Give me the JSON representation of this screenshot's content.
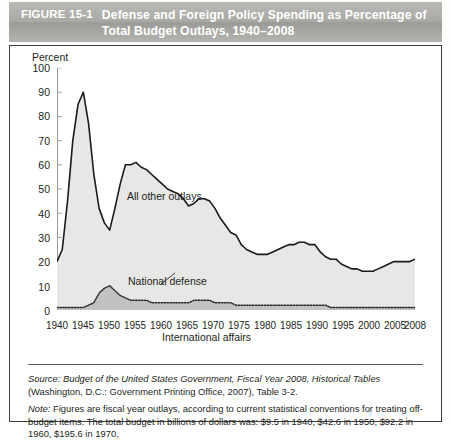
{
  "figure": {
    "number": "FIGURE 15-1",
    "title": "Defense and Foreign Policy Spending as Percentage of Total Budget Outlays, 1940–2008"
  },
  "chart_data": {
    "type": "area",
    "title": "Defense and Foreign Policy Spending as Percentage of Total Budget Outlays, 1940–2008",
    "xlabel": "",
    "ylabel": "Percent",
    "ylim": [
      0,
      100
    ],
    "xlim": [
      1940,
      2008
    ],
    "grid": false,
    "legend_position": "inline-annotations",
    "ytick_labels": [
      "0",
      "10",
      "20",
      "30",
      "40",
      "50",
      "60",
      "70",
      "80",
      "90",
      "100"
    ],
    "xtick_labels": [
      "1940",
      "1945",
      "1950",
      "1955",
      "1960",
      "1965",
      "1970",
      "1975",
      "1980",
      "1985",
      "1990",
      "1995",
      "2000",
      "2005",
      "2008"
    ],
    "annotations": [
      {
        "text": "All other outlays",
        "x": 1958,
        "y": 72
      },
      {
        "text": "National defense",
        "x": 1960,
        "y": 38
      },
      {
        "text": "International affairs",
        "x": 1962,
        "y": 11
      }
    ],
    "x": [
      1940,
      1941,
      1942,
      1943,
      1944,
      1945,
      1946,
      1947,
      1948,
      1949,
      1950,
      1951,
      1952,
      1953,
      1954,
      1955,
      1956,
      1957,
      1958,
      1959,
      1960,
      1961,
      1962,
      1963,
      1964,
      1965,
      1966,
      1967,
      1968,
      1969,
      1970,
      1971,
      1972,
      1973,
      1974,
      1975,
      1976,
      1977,
      1978,
      1979,
      1980,
      1981,
      1982,
      1983,
      1984,
      1985,
      1986,
      1987,
      1988,
      1989,
      1990,
      1991,
      1992,
      1993,
      1994,
      1995,
      1996,
      1997,
      1998,
      1999,
      2000,
      2001,
      2002,
      2003,
      2004,
      2005,
      2006,
      2007,
      2008
    ],
    "series": [
      {
        "name": "National defense",
        "values": [
          20,
          25,
          45,
          70,
          85,
          90,
          77,
          56,
          42,
          36,
          33,
          42,
          52,
          60,
          60,
          61,
          59,
          58,
          56,
          54,
          52,
          50,
          49,
          48,
          46,
          43,
          44,
          46,
          46,
          45,
          42,
          38,
          35,
          32,
          31,
          27,
          25,
          24,
          23,
          23,
          23,
          24,
          25,
          26,
          27,
          27,
          28,
          28,
          27,
          27,
          24,
          22,
          21,
          21,
          19,
          18,
          17,
          17,
          16,
          16,
          16,
          17,
          18,
          19,
          20,
          20,
          20,
          20,
          21
        ]
      },
      {
        "name": "International affairs",
        "values": [
          1,
          1,
          1,
          1,
          1,
          1,
          2,
          3,
          7,
          9,
          10,
          8,
          6,
          5,
          4,
          4,
          4,
          4,
          3,
          3,
          3,
          3,
          3,
          3,
          3,
          3,
          4,
          4,
          4,
          4,
          3,
          3,
          3,
          3,
          2,
          2,
          2,
          2,
          2,
          2,
          2,
          2,
          2,
          2,
          2,
          2,
          2,
          2,
          2,
          2,
          2,
          2,
          1,
          1,
          1,
          1,
          1,
          1,
          1,
          1,
          1,
          1,
          1,
          1,
          1,
          1,
          1,
          1,
          1
        ]
      }
    ],
    "colors": {
      "line": "#1a1a1a",
      "national_defense_fill": "#e6e6e6",
      "international_affairs_fill": "#bdbdbd",
      "axis": "#8a8a8a"
    }
  },
  "footnotes": {
    "source_label": "Source:",
    "source_italic": "Budget of the United States Government, Fiscal Year 2008, Historical Tables",
    "source_rest": " (Washington, D.C.: Government Printing Office, 2007), Table 3-2.",
    "note_label": "Note:",
    "note_text": " Figures are fiscal year outlays, according to current statistical conventions for treating off-budget",
    "note_text_clipped": "items. The total budget in billions of dollars was: $9.5 in 1940, $42.6 in 1950, $92.2 in 1960, $195.6 in 1970,"
  }
}
